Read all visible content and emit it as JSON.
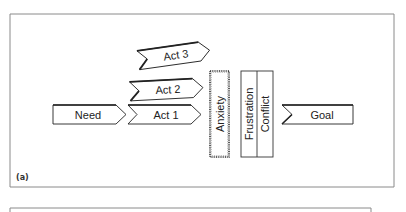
{
  "figure": {
    "panel_label": "(a)",
    "colors": {
      "frame": "#8a8a8a",
      "stroke": "#222222",
      "fill": "#ffffff",
      "text": "#222222"
    }
  },
  "nodes": {
    "need": {
      "label": "Need"
    },
    "act1": {
      "label": "Act 1"
    },
    "act2": {
      "label": "Act 2"
    },
    "act3": {
      "label": "Act 3"
    },
    "anxiety": {
      "label": "Anxiety"
    },
    "frustration": {
      "label": "Frustration"
    },
    "conflict": {
      "label": "Conflict"
    },
    "goal": {
      "label": "Goal"
    }
  }
}
